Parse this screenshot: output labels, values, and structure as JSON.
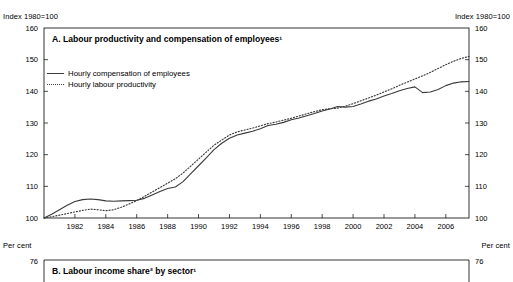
{
  "figure": {
    "panel_a": {
      "title": "A. Labour productivity and compensation of employees¹",
      "unit_left": "Index 1980=100",
      "unit_right": "Index 1980=100"
    },
    "panel_b": {
      "title": "B. Labour income share² by sector¹",
      "unit_left": "Per cent",
      "unit_right": "Per cent",
      "top_tick_left": "76",
      "top_tick_right": "76"
    }
  },
  "chart_data": {
    "type": "line",
    "title": "A. Labour productivity and compensation of employees¹",
    "xlabel": "",
    "ylabel": "Index 1980=100",
    "xlim": [
      1980,
      2007.5
    ],
    "ylim": [
      100,
      160
    ],
    "yticks": [
      100,
      110,
      120,
      130,
      140,
      150,
      160
    ],
    "xticks": [
      1982,
      1984,
      1986,
      1988,
      1990,
      1992,
      1994,
      1996,
      1998,
      2000,
      2002,
      2004,
      2006
    ],
    "grid": false,
    "legend_position": "upper-left-inside",
    "x": [
      1980,
      1980.5,
      1981,
      1981.5,
      1982,
      1982.5,
      1983,
      1983.5,
      1984,
      1984.5,
      1985,
      1985.5,
      1986,
      1986.5,
      1987,
      1987.5,
      1988,
      1988.5,
      1989,
      1989.5,
      1990,
      1990.5,
      1991,
      1991.5,
      1992,
      1992.5,
      1993,
      1993.5,
      1994,
      1994.5,
      1995,
      1995.5,
      1996,
      1996.5,
      1997,
      1997.5,
      1998,
      1998.5,
      1999,
      1999.5,
      2000,
      2000.5,
      2001,
      2001.5,
      2002,
      2002.5,
      2003,
      2003.5,
      2004,
      2004.5,
      2005,
      2005.5,
      2006,
      2006.5,
      2007,
      2007.5
    ],
    "series": [
      {
        "name": "Hourly compensation of employees",
        "style": "solid",
        "values": [
          100.0,
          101.2,
          102.6,
          104.0,
          105.2,
          105.8,
          106.0,
          105.8,
          105.4,
          105.3,
          105.4,
          105.5,
          105.6,
          106.2,
          107.3,
          108.4,
          109.3,
          109.8,
          111.5,
          114.0,
          116.5,
          119.0,
          121.6,
          123.6,
          125.2,
          126.2,
          126.8,
          127.4,
          128.2,
          129.2,
          129.6,
          130.2,
          131.0,
          131.6,
          132.3,
          133.0,
          133.8,
          134.4,
          135.2,
          135.0,
          135.2,
          136.0,
          136.9,
          137.6,
          138.5,
          139.3,
          140.2,
          140.9,
          141.4,
          139.6,
          139.8,
          140.6,
          141.8,
          142.6,
          143.0,
          143.1
        ]
      },
      {
        "name": "Hourly labour productivity",
        "style": "dotted",
        "values": [
          100.0,
          100.4,
          100.9,
          101.4,
          101.9,
          102.4,
          102.8,
          102.6,
          102.3,
          102.6,
          103.4,
          104.4,
          105.5,
          106.8,
          108.2,
          109.6,
          111.0,
          112.4,
          114.2,
          116.4,
          118.6,
          120.8,
          123.0,
          124.6,
          126.2,
          127.2,
          127.8,
          128.4,
          129.1,
          129.8,
          130.3,
          130.9,
          131.5,
          132.2,
          132.9,
          133.6,
          134.2,
          134.5,
          134.7,
          135.3,
          136.1,
          137.0,
          137.9,
          138.8,
          139.8,
          140.8,
          141.9,
          142.9,
          143.9,
          144.9,
          146.0,
          147.2,
          148.4,
          149.5,
          150.4,
          151.0
        ]
      }
    ]
  }
}
